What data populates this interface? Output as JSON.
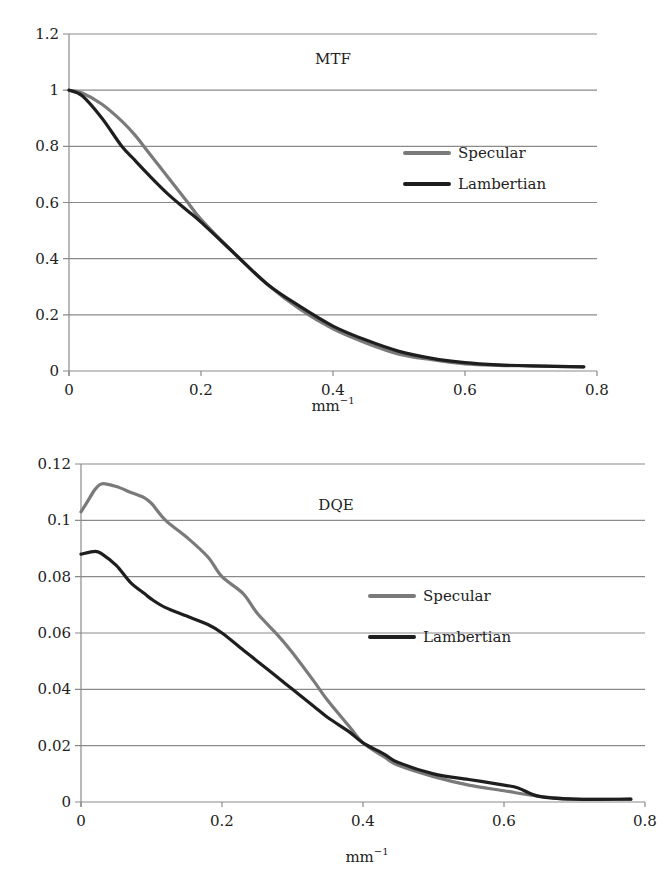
{
  "chart_data": [
    {
      "type": "line",
      "title": "MTF",
      "xlabel": "mm",
      "xlabel_superscript": "−1",
      "ylabel": "",
      "xlim": [
        0,
        0.8
      ],
      "ylim": [
        0,
        1.2
      ],
      "xticks": [
        "0",
        "0.2",
        "0.4",
        "0.6",
        "0.8"
      ],
      "yticks": [
        "0",
        "0.2",
        "0.4",
        "0.6",
        "0.8",
        "1",
        "1.2"
      ],
      "grid": true,
      "legend_position": "right-middle",
      "series": [
        {
          "name": "Specular",
          "color": "#7a7a7a",
          "x": [
            0,
            0.02,
            0.05,
            0.08,
            0.1,
            0.12,
            0.15,
            0.18,
            0.2,
            0.25,
            0.3,
            0.35,
            0.4,
            0.45,
            0.5,
            0.55,
            0.6,
            0.65,
            0.7,
            0.78
          ],
          "y": [
            1.0,
            0.99,
            0.95,
            0.89,
            0.84,
            0.78,
            0.69,
            0.6,
            0.54,
            0.42,
            0.31,
            0.22,
            0.15,
            0.1,
            0.06,
            0.04,
            0.025,
            0.02,
            0.018,
            0.015
          ]
        },
        {
          "name": "Lambertian",
          "color": "#1e1e1e",
          "x": [
            0,
            0.02,
            0.05,
            0.08,
            0.1,
            0.12,
            0.15,
            0.18,
            0.2,
            0.25,
            0.3,
            0.35,
            0.4,
            0.45,
            0.5,
            0.55,
            0.6,
            0.65,
            0.7,
            0.78
          ],
          "y": [
            1.0,
            0.98,
            0.9,
            0.8,
            0.75,
            0.7,
            0.63,
            0.57,
            0.53,
            0.42,
            0.31,
            0.23,
            0.16,
            0.11,
            0.07,
            0.045,
            0.03,
            0.022,
            0.018,
            0.015
          ]
        }
      ]
    },
    {
      "type": "line",
      "title": "DQE",
      "xlabel": "mm",
      "xlabel_superscript": "−1",
      "ylabel": "",
      "xlim": [
        0,
        0.8
      ],
      "ylim": [
        0,
        0.12
      ],
      "xticks": [
        "0",
        "0.2",
        "0.4",
        "0.6",
        "0.8"
      ],
      "yticks": [
        "0",
        "0.02",
        "0.04",
        "0.06",
        "0.08",
        "0.1",
        "0.12"
      ],
      "grid": true,
      "legend_position": "right-middle",
      "series": [
        {
          "name": "Specular",
          "color": "#7a7a7a",
          "x": [
            0,
            0.01,
            0.02,
            0.03,
            0.05,
            0.07,
            0.09,
            0.1,
            0.12,
            0.15,
            0.18,
            0.2,
            0.23,
            0.25,
            0.28,
            0.3,
            0.33,
            0.35,
            0.38,
            0.4,
            0.43,
            0.45,
            0.5,
            0.55,
            0.6,
            0.65,
            0.7,
            0.78
          ],
          "y": [
            0.103,
            0.107,
            0.111,
            0.113,
            0.112,
            0.11,
            0.108,
            0.106,
            0.1,
            0.094,
            0.087,
            0.08,
            0.074,
            0.067,
            0.059,
            0.053,
            0.043,
            0.036,
            0.027,
            0.021,
            0.016,
            0.013,
            0.009,
            0.006,
            0.004,
            0.002,
            0.001,
            0.001
          ]
        },
        {
          "name": "Lambertian",
          "color": "#1e1e1e",
          "x": [
            0,
            0.02,
            0.03,
            0.05,
            0.07,
            0.09,
            0.1,
            0.12,
            0.15,
            0.18,
            0.2,
            0.23,
            0.25,
            0.28,
            0.3,
            0.33,
            0.35,
            0.38,
            0.4,
            0.43,
            0.45,
            0.5,
            0.55,
            0.6,
            0.62,
            0.65,
            0.7,
            0.78
          ],
          "y": [
            0.088,
            0.089,
            0.088,
            0.084,
            0.078,
            0.074,
            0.072,
            0.069,
            0.066,
            0.063,
            0.06,
            0.054,
            0.05,
            0.044,
            0.04,
            0.034,
            0.03,
            0.025,
            0.021,
            0.017,
            0.014,
            0.01,
            0.008,
            0.006,
            0.005,
            0.002,
            0.001,
            0.001
          ]
        }
      ]
    }
  ]
}
